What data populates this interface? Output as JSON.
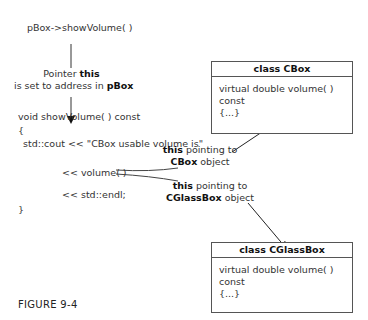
{
  "top_call": "pBox->showVolume( )",
  "pointer_label": {
    "line1_prefix": "Pointer ",
    "line1_bold": "this",
    "line2_prefix": "is set to address in ",
    "line2_bold": "pBox"
  },
  "code": {
    "signature": "void showVolume( ) const",
    "open_brace": "{",
    "cout_line": "std::cout << \"CBox usable volume is\"",
    "volume_line": "<< volume( )",
    "endl_line": "<< std::endl;",
    "close_brace": "}"
  },
  "annotations": {
    "cbox": {
      "bold": "this",
      "text1": " pointing to",
      "bold2": "CBox",
      "text2": " object"
    },
    "cglassbox": {
      "bold": "this",
      "text1": " pointing to",
      "bold2": "CGlassBox",
      "text2": " object"
    }
  },
  "class_boxes": [
    {
      "title": "class CBox",
      "method": "virtual double volume( ) const",
      "body": "{...}"
    },
    {
      "title": "class CGlassBox",
      "method": "virtual double volume( ) const",
      "body": "{...}"
    }
  ],
  "caption": "FIGURE 9-4"
}
